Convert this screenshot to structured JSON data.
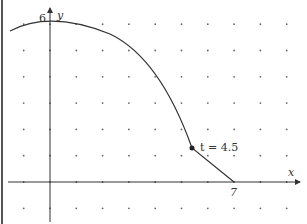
{
  "diagram": {
    "x_axis_label": "x",
    "y_axis_label": "y",
    "y_tick_label": "6",
    "x_tick_label": "7",
    "point_label": "t = 4.5",
    "curve_color": "#333333",
    "grid_dot_color": "#555555"
  }
}
